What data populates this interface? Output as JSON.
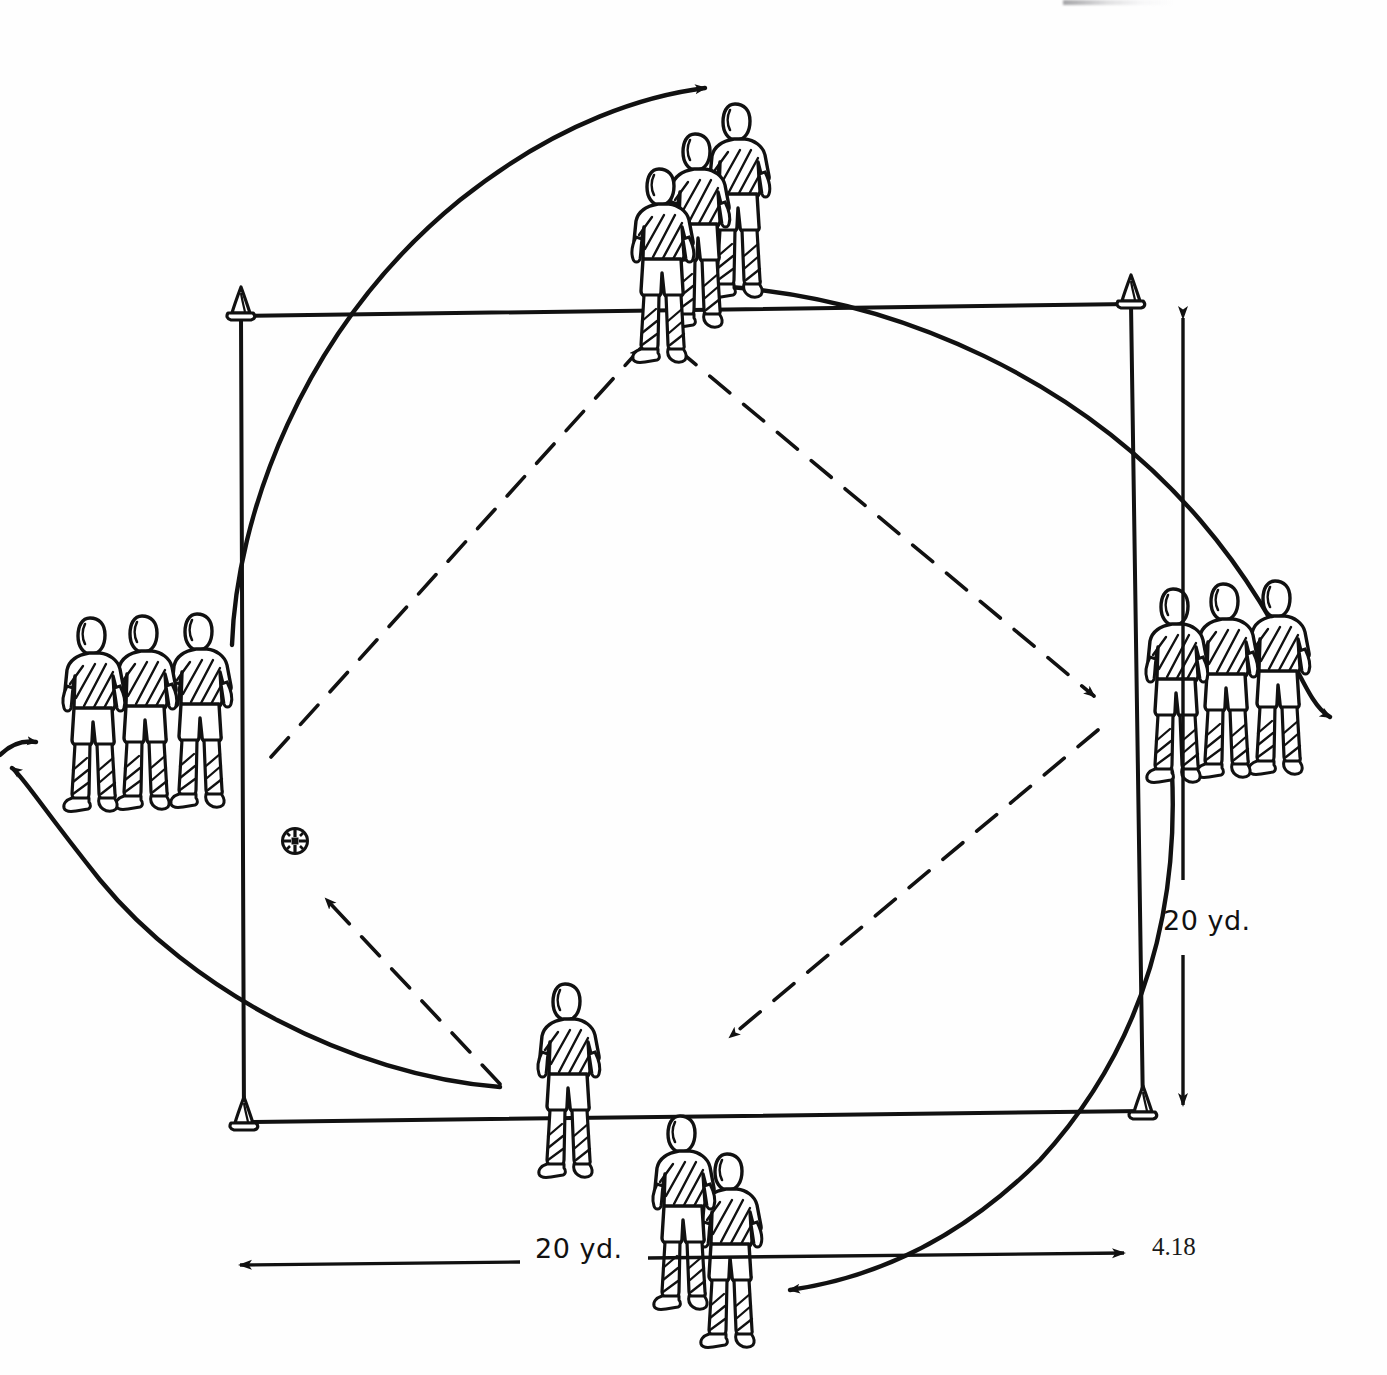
{
  "figure": {
    "number": "4.18"
  },
  "dimensions": {
    "width_label": "20 yd.",
    "height_label": "20 yd.",
    "width_value": 20,
    "height_value": 20,
    "unit": "yd."
  },
  "grid": {
    "shape": "square",
    "corner_markers": "cone",
    "corners": [
      {
        "name": "top-left",
        "x": 240,
        "y": 315
      },
      {
        "name": "top-right",
        "x": 1130,
        "y": 303
      },
      {
        "name": "bottom-right",
        "x": 1143,
        "y": 1110
      },
      {
        "name": "bottom-left",
        "x": 243,
        "y": 1121
      }
    ]
  },
  "groups": [
    {
      "name": "top-group",
      "position": "top-center",
      "player_count": 3
    },
    {
      "name": "left-group",
      "position": "left-side",
      "player_count": 3
    },
    {
      "name": "right-group",
      "position": "right-side",
      "player_count": 3
    },
    {
      "name": "bottom-group",
      "position": "bottom-center",
      "player_count": 3
    }
  ],
  "ball": {
    "name": "soccer-ball",
    "x": 295,
    "y": 841
  },
  "passes": [
    {
      "name": "pass-bottom-left-to-top",
      "style": "dashed",
      "from": "bottom-left-area",
      "to": "top-group"
    },
    {
      "name": "pass-top-to-right",
      "style": "dashed",
      "from": "top-group",
      "to": "right-group"
    },
    {
      "name": "pass-right-to-bottom",
      "style": "dashed",
      "from": "right-group",
      "to": "bottom-group"
    },
    {
      "name": "pass-bottom-to-left",
      "style": "dashed",
      "from": "bottom-group",
      "to": "ball"
    }
  ],
  "runs": [
    {
      "name": "run-left-to-top",
      "style": "solid-curve",
      "from": "left-group",
      "to": "top-group"
    },
    {
      "name": "run-top-to-right",
      "style": "solid-curve",
      "from": "top-group",
      "to": "right-group"
    },
    {
      "name": "run-right-to-bottom",
      "style": "solid-curve",
      "from": "right-group",
      "to": "bottom-group"
    },
    {
      "name": "run-bottom-to-left",
      "style": "solid-curve",
      "from": "bottom-group",
      "to": "left-group"
    }
  ],
  "colors": {
    "ink": "#111111",
    "paper": "#fefefe"
  }
}
